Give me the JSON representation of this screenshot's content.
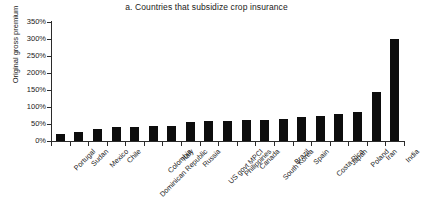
{
  "chart_data": {
    "type": "bar",
    "title": "a. Countries that subsidize crop insurance",
    "xlabel": "",
    "ylabel": "Original gross premium",
    "ylim": [
      0,
      350
    ],
    "ytick_values": [
      0,
      50,
      100,
      150,
      200,
      250,
      300,
      350
    ],
    "ytick_labels": [
      "0%",
      "50%",
      "100%",
      "150%",
      "200%",
      "250%",
      "300%",
      "350%"
    ],
    "grid": false,
    "legend": null,
    "bar_color": "#0d0d0d",
    "categories": [
      "Portugal",
      "Sudan",
      "Mexico",
      "Chile",
      "Dominican Republic",
      "Colombia",
      "Italy",
      "Russia",
      "US govt MPCI",
      "Philippines",
      "Canada",
      "South Korea",
      "Brazil",
      "Spain",
      "Costa Rica",
      "Japan",
      "Poland",
      "Iran",
      "India"
    ],
    "values": [
      22,
      26,
      35,
      40,
      42,
      43,
      45,
      55,
      58,
      60,
      62,
      63,
      65,
      70,
      75,
      80,
      85,
      145,
      300
    ]
  }
}
